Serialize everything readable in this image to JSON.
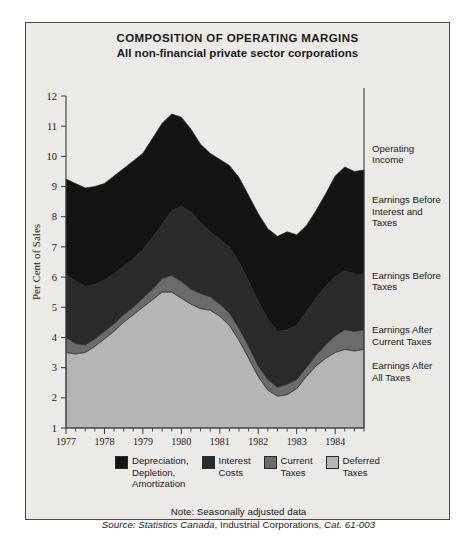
{
  "figure": {
    "title": "COMPOSITION OF OPERATING MARGINS",
    "subtitle": "All non-financial private sector corporations"
  },
  "footer": {
    "note": "Note: Seasonally adjusted data",
    "source_label": "Source:",
    "source_publisher": "Statistics Canada",
    "source_series": ", Industrial Corporations, ",
    "source_catalogue": "Cat. 61-003"
  },
  "legend": [
    {
      "label": "Depreciation,\nDepletion,\nAmortization",
      "color": "#141414",
      "name": "depreciation-depletion-amortization"
    },
    {
      "label": "Interest\nCosts",
      "color": "#2b2b2b",
      "name": "interest-costs"
    },
    {
      "label": "Current\nTaxes",
      "color": "#6b6b6b",
      "name": "current-taxes"
    },
    {
      "label": "Deferred\nTaxes",
      "color": "#b5b5b5",
      "name": "deferred-taxes"
    }
  ],
  "callouts": [
    {
      "label": "Operating\nIncome",
      "y": 10.15,
      "name": "operating-income"
    },
    {
      "label": "Earnings Before\nInterest and\nTaxes",
      "y": 8.45,
      "name": "earnings-before-interest-and-taxes"
    },
    {
      "label": "Earnings Before\nTaxes",
      "y": 5.95,
      "name": "earnings-before-taxes"
    },
    {
      "label": "Earnings After\nCurrent Taxes",
      "y": 4.15,
      "name": "earnings-after-current-taxes"
    },
    {
      "label": "Earnings After\nAll Taxes",
      "y": 2.95,
      "name": "earnings-after-all-taxes"
    }
  ],
  "chart_data": {
    "type": "area",
    "stacked": true,
    "title": "COMPOSITION OF OPERATING MARGINS",
    "subtitle": "All non-financial private sector corporations",
    "xlabel": "",
    "ylabel": "Per Cent of Sales",
    "xlim": [
      1977.0,
      1984.75
    ],
    "ylim": [
      1,
      12
    ],
    "yticks": [
      1,
      2,
      3,
      4,
      5,
      6,
      7,
      8,
      9,
      10,
      11,
      12
    ],
    "xticks": [
      1977,
      1978,
      1979,
      1980,
      1981,
      1982,
      1983,
      1984
    ],
    "x_minor_interval": 0.25,
    "grid": false,
    "legend_position": "bottom",
    "x": [
      1977.0,
      1977.25,
      1977.5,
      1977.75,
      1978.0,
      1978.25,
      1978.5,
      1978.75,
      1979.0,
      1979.25,
      1979.5,
      1979.75,
      1980.0,
      1980.25,
      1980.5,
      1980.75,
      1981.0,
      1981.25,
      1981.5,
      1981.75,
      1982.0,
      1982.25,
      1982.5,
      1982.75,
      1983.0,
      1983.25,
      1983.5,
      1983.75,
      1984.0,
      1984.25,
      1984.5,
      1984.75
    ],
    "boundaries": {
      "operating_income": [
        9.25,
        9.1,
        8.95,
        9.0,
        9.1,
        9.35,
        9.6,
        9.85,
        10.1,
        10.6,
        11.1,
        11.4,
        11.3,
        10.9,
        10.4,
        10.1,
        9.9,
        9.7,
        9.3,
        8.7,
        8.1,
        7.6,
        7.35,
        7.5,
        7.4,
        7.7,
        8.2,
        8.75,
        9.35,
        9.65,
        9.5,
        9.55
      ],
      "earnings_before_interest_and_taxes": [
        6.1,
        5.85,
        5.7,
        5.75,
        5.9,
        6.1,
        6.35,
        6.6,
        6.9,
        7.3,
        7.75,
        8.2,
        8.35,
        8.15,
        7.8,
        7.5,
        7.25,
        7.0,
        6.5,
        5.85,
        5.2,
        4.6,
        4.2,
        4.25,
        4.4,
        4.85,
        5.3,
        5.7,
        6.0,
        6.2,
        6.1,
        6.1
      ],
      "earnings_before_taxes": [
        4.0,
        3.8,
        3.75,
        3.95,
        4.2,
        4.45,
        4.75,
        5.0,
        5.3,
        5.6,
        5.95,
        6.05,
        5.85,
        5.6,
        5.45,
        5.35,
        5.1,
        4.8,
        4.3,
        3.7,
        3.05,
        2.6,
        2.35,
        2.45,
        2.6,
        3.0,
        3.4,
        3.75,
        4.05,
        4.25,
        4.2,
        4.25
      ],
      "earnings_after_current_taxes": [
        3.5,
        3.45,
        3.5,
        3.7,
        3.95,
        4.2,
        4.5,
        4.75,
        5.0,
        5.25,
        5.5,
        5.5,
        5.3,
        5.1,
        4.95,
        4.9,
        4.7,
        4.4,
        3.9,
        3.3,
        2.7,
        2.25,
        2.05,
        2.1,
        2.3,
        2.7,
        3.05,
        3.3,
        3.5,
        3.6,
        3.55,
        3.6
      ]
    },
    "series": [
      {
        "name": "Depreciation, Depletion, Amortization",
        "color": "#141414",
        "from": "earnings_before_interest_and_taxes",
        "to": "operating_income"
      },
      {
        "name": "Interest Costs",
        "color": "#2b2b2b",
        "from": "earnings_before_taxes",
        "to": "earnings_before_interest_and_taxes"
      },
      {
        "name": "Current Taxes",
        "color": "#6b6b6b",
        "from": "earnings_after_current_taxes",
        "to": "earnings_before_taxes"
      },
      {
        "name": "Deferred Taxes",
        "color": "#b5b5b5",
        "from": "baseline",
        "to": "earnings_after_current_taxes"
      }
    ]
  }
}
